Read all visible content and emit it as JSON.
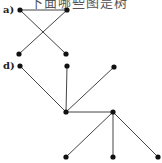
{
  "header": {
    "cut_text": "下面哪些图是树"
  },
  "graphs": [
    {
      "label": "a)",
      "nodes": [
        [
          20,
          10
        ],
        [
          67,
          10
        ],
        [
          19,
          54
        ],
        [
          66,
          54
        ]
      ],
      "edges": [
        [
          0,
          1
        ],
        [
          0,
          3
        ],
        [
          1,
          2
        ]
      ]
    },
    {
      "label": "d)",
      "nodes": [
        [
          20,
          66
        ],
        [
          67,
          66
        ],
        [
          114,
          67
        ],
        [
          66,
          112
        ],
        [
          113,
          112
        ],
        [
          66,
          157
        ],
        [
          113,
          157
        ],
        [
          158,
          157
        ]
      ],
      "edges": [
        [
          0,
          3
        ],
        [
          1,
          3
        ],
        [
          2,
          3
        ],
        [
          3,
          4
        ],
        [
          4,
          5
        ],
        [
          4,
          6
        ],
        [
          4,
          7
        ]
      ]
    }
  ],
  "colors": {
    "edge": "#444444",
    "node": "#111111"
  }
}
